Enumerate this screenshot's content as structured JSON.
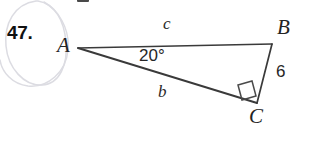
{
  "figure": {
    "problem_number": "47.",
    "type": "right-triangle-diagram",
    "vertices": [
      {
        "name": "A",
        "label": "A",
        "x": 78,
        "y": 48
      },
      {
        "name": "B",
        "label": "B",
        "x": 272,
        "y": 44
      },
      {
        "name": "C",
        "label": "C",
        "x": 257,
        "y": 103
      }
    ],
    "side_labels": {
      "hypotenuse": "c",
      "adjacent": "b",
      "opposite_value": "6"
    },
    "angle_label": "20°",
    "right_angle_at": "C",
    "colors": {
      "background": "#ffffff",
      "stroke": "#3a3a3a",
      "text": "#1d1d1d",
      "scribble": "#dcdce2"
    }
  }
}
